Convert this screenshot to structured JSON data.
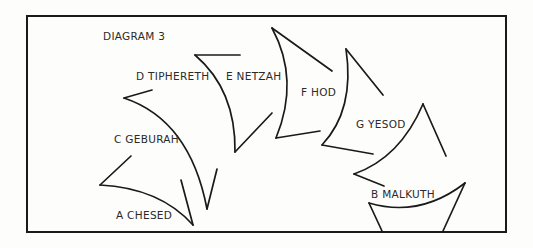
{
  "diagram": {
    "title": "DIAGRAM 3",
    "stroke_color": "#1a1a1a",
    "background_color": "#fdfdfb",
    "labels": {
      "chesed": "A  CHESED",
      "malkuth": "B  MALKUTH",
      "geburah": "C  GEBURAH",
      "tiphereth": "D  TIPHERETH",
      "netzah": "E  NETZAH",
      "hod": "F  HOD",
      "yesod": "G  YESOD"
    }
  }
}
